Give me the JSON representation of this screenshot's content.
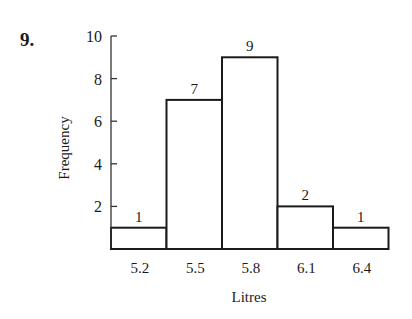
{
  "question_number": "9.",
  "chart_data": {
    "type": "bar",
    "subtype": "histogram",
    "title": "",
    "xlabel": "Litres",
    "ylabel": "Frequency",
    "categories": [
      "5.2",
      "5.5",
      "5.8",
      "6.1",
      "6.4"
    ],
    "values": [
      1,
      7,
      9,
      2,
      1
    ],
    "data_labels": [
      "1",
      "7",
      "9",
      "2",
      "1"
    ],
    "ylim": [
      0,
      10
    ],
    "yticks": [
      2,
      4,
      6,
      8,
      10
    ],
    "ytick_labels": [
      "2",
      "4",
      "6",
      "8",
      "10"
    ],
    "grid": false,
    "legend": null
  }
}
